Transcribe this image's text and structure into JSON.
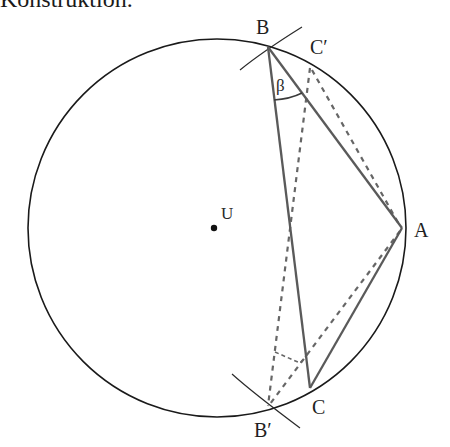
{
  "heading": "Konstruktion.",
  "diagram": {
    "circle": {
      "center_label": "U"
    },
    "points": {
      "A": "A",
      "B": "B",
      "C": "C",
      "B_prime": "B′",
      "C_prime": "C′"
    },
    "angle_label": "β",
    "colors": {
      "circle": "#1a1a1a",
      "solid_triangle": "#5a5a5a",
      "dashed_lines": "#666666",
      "arcs": "#2a2a2a"
    }
  }
}
